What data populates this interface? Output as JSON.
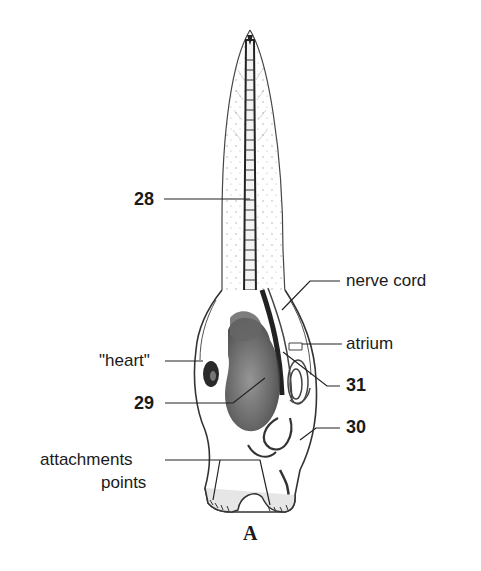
{
  "figure": {
    "panel_letter": "A"
  },
  "labels": {
    "l28": "28",
    "nerve_cord": "nerve cord",
    "atrium": "atrium",
    "heart": "\"heart\"",
    "l31": "31",
    "l29": "29",
    "l30": "30",
    "attachments_line1": "attachments",
    "attachments_line2": "points"
  }
}
